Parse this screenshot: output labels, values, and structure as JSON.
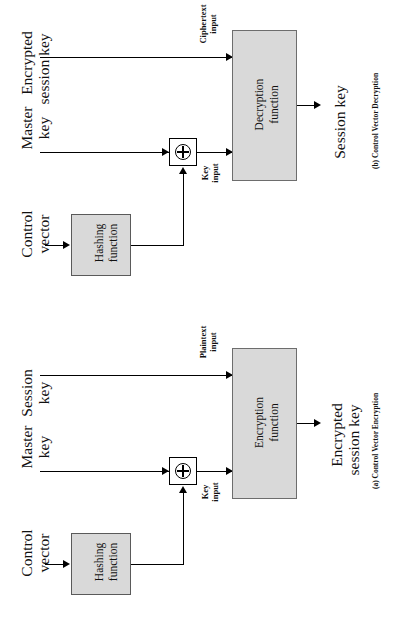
{
  "figure": {
    "orientation": "rotated-90-ccw",
    "background": "#ffffff",
    "box_fill": "#d9d9d9",
    "line_color": "#000000"
  },
  "panels": [
    {
      "id": "decryption",
      "caption": "(b) Control Vector Decryption",
      "inputs": {
        "top_label_line1": "Encrypted",
        "top_label_line2": "session key",
        "top_port": "Ciphertext\ninput",
        "top_port_line1": "Ciphertext",
        "top_port_line2": "input",
        "mid_label_line1": "Master",
        "mid_label_line2": "key",
        "mid_port_line1": "Key",
        "mid_port_line2": "input",
        "bottom_label_line1": "Control",
        "bottom_label_line2": "vector"
      },
      "hash_box_line1": "Hashing",
      "hash_box_line2": "function",
      "xor_symbol": "⊕",
      "function_box_line1": "Decryption",
      "function_box_line2": "function",
      "output_line1": "Session key",
      "output_line2": ""
    },
    {
      "id": "encryption",
      "caption": "(a) Control Vector Encryption",
      "inputs": {
        "top_label_line1": "Session",
        "top_label_line2": "key",
        "top_port_line1": "Plaintext",
        "top_port_line2": "input",
        "mid_label_line1": "Master",
        "mid_label_line2": "key",
        "mid_port_line1": "Key",
        "mid_port_line2": "input",
        "bottom_label_line1": "Control",
        "bottom_label_line2": "vector"
      },
      "hash_box_line1": "Hashing",
      "hash_box_line2": "function",
      "xor_symbol": "⊕",
      "function_box_line1": "Encryption",
      "function_box_line2": "function",
      "output_line1": "Encrypted",
      "output_line2": "session key"
    }
  ]
}
